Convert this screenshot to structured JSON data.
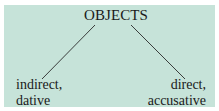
{
  "diagram": {
    "background_color": "#c6e3d9",
    "text_color": "#1a1a1a",
    "line_color": "#2a2a2a",
    "root": {
      "label": "OBJECTS"
    },
    "children": [
      {
        "line1": "indirect,",
        "line2": "dative"
      },
      {
        "line1": "direct,",
        "line2": "accusative"
      }
    ]
  }
}
